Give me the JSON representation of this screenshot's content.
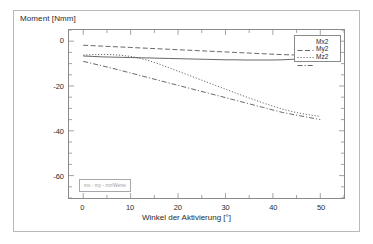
{
  "figure": {
    "annotation_text": "mx - my - mz/Werte"
  },
  "chart_data": {
    "type": "line",
    "title": "",
    "xlabel": "Winkel der Aktivierung [°]",
    "ylabel": "Moment [Nmm]",
    "xlim": [
      -3,
      55
    ],
    "ylim": [
      -70,
      5
    ],
    "xticks": [
      0,
      10,
      20,
      30,
      40,
      50
    ],
    "xtick_labels": [
      "0",
      "10",
      "20",
      "30",
      "40",
      "50"
    ],
    "yticks": [
      0,
      -20,
      -40,
      -60
    ],
    "ytick_labels": [
      "0",
      "-20",
      "-40",
      "-60"
    ],
    "grid": false,
    "legend_position": "top-right",
    "line_color": "#333333",
    "series": [
      {
        "name": "Mx2",
        "style": "dashed",
        "x": [
          0,
          2,
          4,
          6,
          8,
          10,
          12,
          14,
          16,
          18,
          20,
          22,
          24,
          26,
          28,
          30,
          32,
          34,
          36,
          38,
          40,
          42,
          44,
          46,
          48,
          50
        ],
        "values": [
          -1.8,
          -2.0,
          -2.2,
          -2.4,
          -2.6,
          -2.8,
          -3.0,
          -3.2,
          -3.4,
          -3.6,
          -3.8,
          -4.0,
          -4.2,
          -4.4,
          -4.6,
          -4.8,
          -5.0,
          -5.2,
          -5.4,
          -5.6,
          -5.8,
          -6.0,
          -6.1,
          -6.2,
          -6.0,
          -5.4
        ]
      },
      {
        "name": "My2",
        "style": "dotted",
        "x": [
          0,
          2,
          4,
          6,
          8,
          10,
          12,
          14,
          16,
          18,
          20,
          22,
          24,
          26,
          28,
          30,
          32,
          34,
          36,
          38,
          40,
          42,
          44,
          46,
          48,
          50
        ],
        "values": [
          -6.2,
          -6.0,
          -5.9,
          -6.0,
          -6.3,
          -6.8,
          -7.6,
          -8.8,
          -10.2,
          -11.8,
          -13.4,
          -15.0,
          -16.6,
          -18.2,
          -19.8,
          -21.4,
          -23.0,
          -24.6,
          -26.1,
          -27.6,
          -29.0,
          -30.3,
          -31.4,
          -32.3,
          -33.0,
          -33.6
        ]
      },
      {
        "name": "Mz2",
        "style": "dashdot",
        "x": [
          0,
          2,
          4,
          6,
          8,
          10,
          12,
          14,
          16,
          18,
          20,
          22,
          24,
          26,
          28,
          30,
          32,
          34,
          36,
          38,
          40,
          42,
          44,
          46,
          48,
          50
        ],
        "values": [
          -9.0,
          -10.0,
          -11.0,
          -12.0,
          -13.1,
          -14.2,
          -15.3,
          -16.4,
          -17.5,
          -18.6,
          -19.7,
          -20.8,
          -21.9,
          -23.0,
          -24.1,
          -25.2,
          -26.3,
          -27.4,
          -28.5,
          -29.6,
          -30.7,
          -31.8,
          -32.6,
          -33.4,
          -34.2,
          -35.0
        ]
      },
      {
        "name": "flat-lower",
        "style": "solid",
        "x": [
          0,
          2,
          4,
          6,
          8,
          10,
          12,
          14,
          16,
          18,
          20,
          22,
          24,
          26,
          28,
          30,
          32,
          34,
          36,
          38,
          40,
          42,
          44,
          46,
          48,
          50
        ],
        "values": [
          -6.6,
          -6.8,
          -7.0,
          -7.1,
          -7.2,
          -7.3,
          -7.4,
          -7.5,
          -7.6,
          -7.7,
          -7.8,
          -7.9,
          -8.0,
          -8.1,
          -8.2,
          -8.3,
          -8.3,
          -8.4,
          -8.4,
          -8.4,
          -8.4,
          -8.3,
          -8.1,
          -7.8,
          -7.2,
          -6.2
        ]
      }
    ],
    "legend": [
      {
        "label": "Mx2",
        "style": "dashed"
      },
      {
        "label": "My2",
        "style": "dotted"
      },
      {
        "label": "Mz2",
        "style": "dashdot"
      }
    ]
  }
}
